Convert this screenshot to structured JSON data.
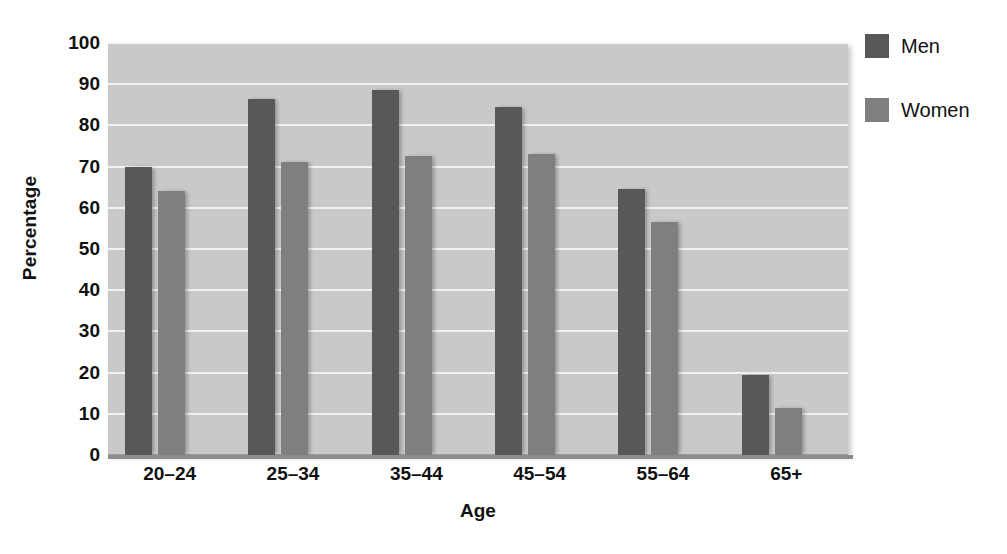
{
  "chart_data": {
    "type": "bar",
    "title": "",
    "xlabel": "Age",
    "ylabel": "Percentage",
    "categories": [
      "20–24",
      "25–34",
      "35–44",
      "45–54",
      "55–64",
      "65+"
    ],
    "series": [
      {
        "name": "Men",
        "color": "#585858",
        "values": [
          70,
          86.5,
          88.5,
          84.5,
          64.5,
          19.5
        ]
      },
      {
        "name": "Women",
        "color": "#7f7f7f",
        "values": [
          64,
          71,
          72.5,
          73,
          56.5,
          11.5
        ]
      }
    ],
    "ylim": [
      0,
      100
    ],
    "yticks": [
      0,
      10,
      20,
      30,
      40,
      50,
      60,
      70,
      80,
      90,
      100
    ],
    "ytick_labels": [
      "0",
      "10",
      "20",
      "30",
      "40",
      "50",
      "60",
      "70",
      "80",
      "90",
      "100"
    ],
    "grid": true,
    "grid_color": "#f2f2f2",
    "plot_background": "#c9c9c9",
    "legend_position": "right"
  },
  "legend": {
    "items": [
      {
        "label": "Men",
        "color": "#585858"
      },
      {
        "label": "Women",
        "color": "#7f7f7f"
      }
    ]
  }
}
